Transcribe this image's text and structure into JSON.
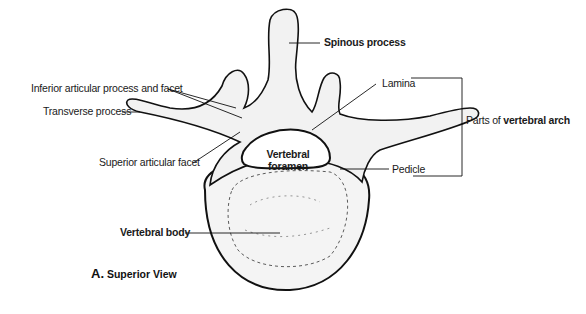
{
  "diagram": {
    "type": "anatomical-illustration",
    "caption": {
      "letter": "A.",
      "text": "Superior View"
    },
    "labels": {
      "spinous_process": "Spinous process",
      "inferior_articular": "Inferior articular process and facet",
      "transverse_process": "Transverse process",
      "lamina": "Lamina",
      "parts_prefix": "Parts of ",
      "parts_bold": "vertebral arch",
      "superior_articular": "Superior articular facet",
      "foramen_line1": "Vertebral",
      "foramen_line2": "foramen",
      "pedicle": "Pedicle",
      "vertebral_body": "Vertebral body"
    },
    "colors": {
      "line": "#111111",
      "bone_fill": "#f3f3f3",
      "background": "#ffffff"
    }
  }
}
